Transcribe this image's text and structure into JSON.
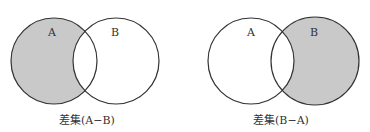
{
  "colors": {
    "fill": "#c9c9c9",
    "stroke": "#333333",
    "background": "#ffffff"
  },
  "diagrams": [
    {
      "caption": "差集(A−B)",
      "shaded": "A minus B",
      "circles": [
        {
          "label": "A",
          "cx": 54,
          "cy": 61,
          "r": 43
        },
        {
          "label": "B",
          "cx": 116,
          "cy": 61,
          "r": 43
        }
      ]
    },
    {
      "caption": "差集(B−A)",
      "shaded": "B minus A",
      "circles": [
        {
          "label": "A",
          "cx": 251,
          "cy": 61,
          "r": 43
        },
        {
          "label": "B",
          "cx": 315,
          "cy": 61,
          "r": 44
        }
      ]
    }
  ]
}
